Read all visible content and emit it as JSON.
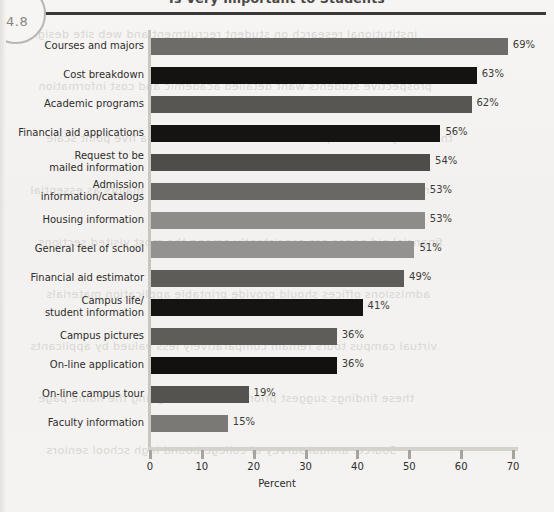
{
  "figure": {
    "number": "4.8",
    "title": "Is Very Important to Students"
  },
  "chart_data": {
    "type": "bar",
    "orientation": "horizontal",
    "title": "Is Very Important to Students",
    "xlabel": "Percent",
    "ylabel": "",
    "xlim": [
      0,
      70
    ],
    "xticks": [
      0,
      10,
      20,
      30,
      40,
      50,
      60,
      70
    ],
    "grid": false,
    "legend": "none",
    "value_suffix": "%",
    "categories": [
      "Courses and majors",
      "Cost breakdown",
      "Academic programs",
      "Financial aid applications",
      "Request to be\nmailed information",
      "Admission\ninformation/catalogs",
      "Housing information",
      "General feel of school",
      "Financial aid estimator",
      "Campus life/\nstudent information",
      "Campus pictures",
      "On-line application",
      "On-line campus tour",
      "Faculty information"
    ],
    "values": [
      69,
      63,
      62,
      56,
      54,
      53,
      53,
      51,
      49,
      41,
      36,
      36,
      19,
      15
    ],
    "value_labels": [
      "69%",
      "63%",
      "62%",
      "56%",
      "54%",
      "53%",
      "53%",
      "51%",
      "49%",
      "41%",
      "36%",
      "36%",
      "19%",
      "15%"
    ],
    "bar_colors": [
      "#6e6c69",
      "#141312",
      "#585653",
      "#151413",
      "#4f4d4a",
      "#6a6865",
      "#8e8c89",
      "#949290",
      "#5e5c59",
      "#151413",
      "#5f5d5a",
      "#121110",
      "#55534f",
      "#7b7975"
    ]
  },
  "colors": {
    "paper": "#f3f2f0",
    "rule": "#3a3937",
    "axis": "#c9c6c2",
    "text": "#2e2c2a"
  },
  "bleed_lines": [
    "institutional research on student recruitment and web site design",
    "prospective students want detailed academic and cost information",
    "the survey asked respondents to rate each item on a five point scale",
    "note that nearly seven in ten rated courses and majors as essential",
    "financial aid pages are consistently among the most visited sections",
    "admissions offices should provide printable application materials",
    "virtual campus tours remain comparatively less valued by applicants",
    "these findings suggest priorities for redesigning the home page",
    "Source: annual survey of college bound high school seniors"
  ]
}
